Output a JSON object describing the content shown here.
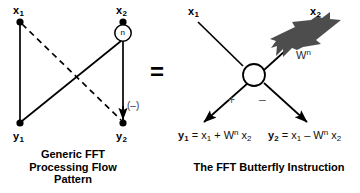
{
  "figure": {
    "background_color": "#ffffff",
    "line_color": "#000000",
    "twiddle_arrow_color": "#4d4d4d",
    "sign_color": "#555555",
    "equals_symbol": "="
  },
  "left_panel": {
    "caption": "Generic FFT\nProcessing Flow\nPattern",
    "inputs": [
      {
        "name": "x1",
        "base": "x",
        "sub": "1"
      },
      {
        "name": "x2",
        "base": "x",
        "sub": "2"
      }
    ],
    "outputs": [
      {
        "name": "y1",
        "base": "y",
        "sub": "1"
      },
      {
        "name": "y2",
        "base": "y",
        "sub": "2"
      }
    ],
    "twiddle_node_label": "n",
    "negative_annotation": "(–)"
  },
  "right_panel": {
    "caption": "The FFT Butterfly Instruction",
    "inputs": [
      {
        "name": "x1",
        "base": "x",
        "sub": "1"
      },
      {
        "name": "x2",
        "base": "x",
        "sub": "2"
      }
    ],
    "twiddle_label": {
      "base": "W",
      "sup": "n"
    },
    "leg_signs": {
      "left": "+",
      "right": "–"
    },
    "formulas": [
      {
        "lhs_base": "y",
        "lhs_sub": "1",
        "eq": "=",
        "term1_base": "x",
        "term1_sub": "1",
        "operator": "+",
        "coef_base": "W",
        "coef_sup": "n",
        "term2_base": "x",
        "term2_sub": "2"
      },
      {
        "lhs_base": "y",
        "lhs_sub": "2",
        "eq": "=",
        "term1_base": "x",
        "term1_sub": "1",
        "operator": "–",
        "coef_base": "W",
        "coef_sup": "n",
        "term2_base": "x",
        "term2_sub": "2"
      }
    ]
  }
}
